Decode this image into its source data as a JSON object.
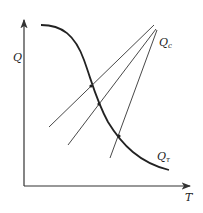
{
  "diagram": {
    "axes": {
      "y_label": "Q",
      "x_label": "T"
    },
    "curves": {
      "heat_removal_label_main": "Q",
      "heat_removal_label_sub": "c",
      "heat_generation_label_main": "Q",
      "heat_generation_label_sub": "τ"
    },
    "colors": {
      "line": "#333333",
      "curve": "#222222",
      "background": "#ffffff"
    }
  }
}
